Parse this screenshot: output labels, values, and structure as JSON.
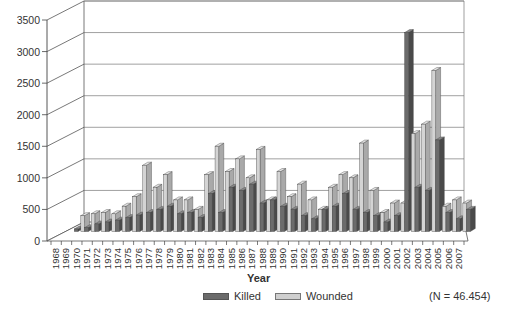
{
  "chart_data": {
    "type": "bar",
    "style": "3d-clustered",
    "title": "",
    "xlabel": "Year",
    "ylabel": "",
    "ylim": [
      0,
      3500
    ],
    "yticks": [
      0,
      500,
      1000,
      1500,
      2000,
      2500,
      3000,
      3500
    ],
    "grid": true,
    "legend_position": "bottom",
    "annotation": "(N = 46.454)",
    "categories": [
      "1968",
      "1969",
      "1970",
      "1971",
      "1972",
      "1973",
      "1974",
      "1975",
      "1976",
      "1977",
      "1978",
      "1979",
      "1980",
      "1981",
      "1982",
      "1983",
      "1984",
      "1985",
      "1986",
      "1987",
      "1988",
      "1989",
      "1990",
      "1991",
      "1992",
      "1993",
      "1994",
      "1995",
      "1996",
      "1997",
      "1998",
      "1999",
      "2000",
      "2001",
      "2002",
      "2003",
      "2004",
      "2005",
      "2006",
      "2007"
    ],
    "series": [
      {
        "name": "Killed",
        "color": "#6b6b6b",
        "values": [
          40,
          60,
          120,
          150,
          180,
          220,
          260,
          300,
          350,
          400,
          280,
          300,
          220,
          600,
          300,
          700,
          650,
          750,
          450,
          500,
          400,
          350,
          250,
          200,
          350,
          400,
          600,
          350,
          300,
          250,
          150,
          250,
          3150,
          700,
          650,
          1450,
          300,
          200,
          350,
          0
        ]
      },
      {
        "name": "Wounded",
        "color": "#cfcfcf",
        "values": [
          0,
          250,
          280,
          300,
          280,
          400,
          550,
          1050,
          700,
          900,
          500,
          500,
          350,
          900,
          1350,
          950,
          1150,
          850,
          1300,
          500,
          950,
          550,
          750,
          500,
          350,
          700,
          900,
          850,
          1400,
          650,
          300,
          450,
          450,
          1550,
          1700,
          2550,
          400,
          500,
          450,
          0
        ]
      }
    ]
  },
  "legend": {
    "killed_label": "Killed",
    "wounded_label": "Wounded"
  },
  "axis": {
    "x_title": "Year"
  },
  "annotation": {
    "n_label": "(N = 46.454)"
  }
}
